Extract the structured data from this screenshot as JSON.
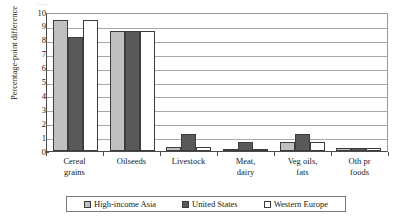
{
  "chart_data": {
    "type": "bar",
    "title": "",
    "xlabel": "",
    "ylabel": "Percentage-point difference",
    "ylim": [
      0,
      10
    ],
    "ytick_labels": [
      "10",
      "9",
      "8",
      "7",
      "6",
      "5",
      "4",
      "3",
      "2",
      "1",
      "0"
    ],
    "grid": true,
    "legend_position": "bottom",
    "categories": [
      [
        "Cereal",
        "grains"
      ],
      [
        "Oilseeds",
        ""
      ],
      [
        "Livestock",
        ""
      ],
      [
        "Meat,",
        "dairy"
      ],
      [
        "Veg oils,",
        "fats"
      ],
      [
        "Oth pr",
        "foods"
      ]
    ],
    "series": [
      {
        "name": "High-income Asia",
        "color": "#c0c0c0",
        "values": [
          9.4,
          8.6,
          0.3,
          0.15,
          0.65,
          0.2
        ]
      },
      {
        "name": "United States",
        "color": "#595959",
        "values": [
          8.2,
          8.65,
          1.2,
          0.65,
          1.2,
          0.2
        ]
      },
      {
        "name": "Western Europe",
        "color": "#ffffff",
        "values": [
          9.4,
          8.6,
          0.3,
          0.15,
          0.65,
          0.2
        ]
      }
    ]
  },
  "title_crop": "····"
}
